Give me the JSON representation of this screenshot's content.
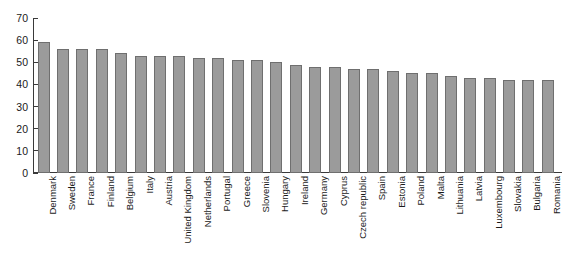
{
  "chart_data": {
    "type": "bar",
    "title": "",
    "subtitle": "",
    "xlabel": "",
    "ylabel": "",
    "ylim": [
      0,
      70
    ],
    "yticks": [
      0,
      10,
      20,
      30,
      40,
      50,
      60,
      70
    ],
    "grid": false,
    "legend": null,
    "orientation": "vertical",
    "bar_color": "#9b9b9b",
    "bar_border_color": "#6f6f6f",
    "axis_color": "#3a3a3a",
    "background": "#ffffff",
    "categories": [
      "Denmark",
      "Sweden",
      "France",
      "Finland",
      "Belgium",
      "Italy",
      "Austria",
      "United Kingdom",
      "Netherlands",
      "Portugal",
      "Greece",
      "Slovenia",
      "Hungary",
      "Ireland",
      "Germany",
      "Cyprus",
      "Czech republic",
      "Spain",
      "Estonia",
      "Poland",
      "Malta",
      "Lithuania",
      "Latvia",
      "Luxembourg",
      "Slovakia",
      "Bulgaria",
      "Romania"
    ],
    "values": [
      59,
      56,
      56,
      56,
      54,
      53,
      53,
      53,
      52,
      52,
      51,
      51,
      50,
      49,
      48,
      48,
      47,
      47,
      46,
      45,
      45,
      44,
      43,
      43,
      42,
      42,
      42
    ]
  }
}
